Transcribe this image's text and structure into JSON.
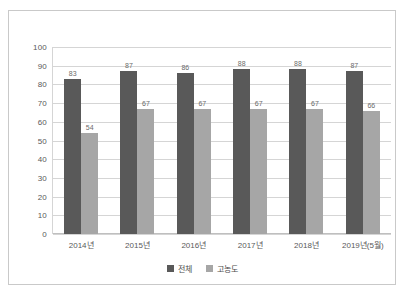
{
  "chart_data": {
    "type": "bar",
    "title": "",
    "xlabel": "",
    "ylabel": "",
    "ylim": [
      0,
      100
    ],
    "ytick_step": 10,
    "yticks": [
      "100",
      "90",
      "80",
      "70",
      "60",
      "50",
      "40",
      "30",
      "20",
      "10",
      "0"
    ],
    "grid": true,
    "legend_position": "bottom",
    "categories": [
      "2014년",
      "2015년",
      "2016년",
      "2017년",
      "2018년",
      "2019년(5월)"
    ],
    "series": [
      {
        "name": "전체",
        "color": "#595959",
        "values": [
          83,
          87,
          86,
          88,
          88,
          87
        ],
        "labels": [
          "83",
          "87",
          "86",
          "88",
          "88",
          "87"
        ]
      },
      {
        "name": "고농도",
        "color": "#a6a6a6",
        "values": [
          54,
          67,
          67,
          67,
          67,
          66
        ],
        "labels": [
          "54",
          "67",
          "67",
          "67",
          "67",
          "66"
        ]
      }
    ]
  },
  "legend": {
    "items": [
      {
        "label": "전체"
      },
      {
        "label": "고농도"
      }
    ]
  }
}
